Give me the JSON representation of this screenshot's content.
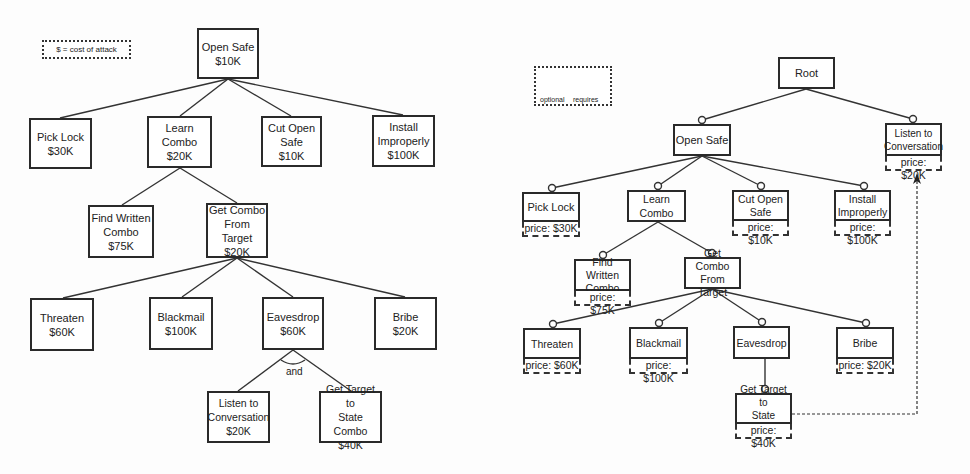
{
  "left_tree": {
    "legend": "$ = cost of attack",
    "and_label": "and",
    "nodes": {
      "open_safe": {
        "label": "Open Safe",
        "cost": "$10K"
      },
      "pick_lock": {
        "label": "Pick Lock",
        "cost": "$30K"
      },
      "learn_combo": {
        "label": "Learn Combo",
        "cost": "$20K"
      },
      "cut_open_safe": {
        "label": "Cut Open\nSafe",
        "cost": "$10K"
      },
      "install_improperly": {
        "label": "Install\nImproperly",
        "cost": "$100K"
      },
      "find_written_combo": {
        "label": "Find Written\nCombo",
        "cost": "$75K"
      },
      "get_combo_from_target": {
        "label": "Get Combo\nFrom Target",
        "cost": "$20K"
      },
      "threaten": {
        "label": "Threaten",
        "cost": "$60K"
      },
      "blackmail": {
        "label": "Blackmail",
        "cost": "$100K"
      },
      "eavesdrop": {
        "label": "Eavesdrop",
        "cost": "$60K"
      },
      "bribe": {
        "label": "Bribe",
        "cost": "$20K"
      },
      "listen_to_conversation": {
        "label": "Listen to\nConversation",
        "cost": "$20K"
      },
      "get_target_to_state_combo": {
        "label": "Get Target to\nState Combo",
        "cost": "$40K"
      }
    }
  },
  "right_tree": {
    "legend": {
      "optional": "optional",
      "requires": "requires"
    },
    "nodes": {
      "root": {
        "label": "Root"
      },
      "open_safe": {
        "label": "Open Safe"
      },
      "listen_to_conversation": {
        "label": "Listen to\nConversation",
        "price": "price: $20K"
      },
      "pick_lock": {
        "label": "Pick Lock",
        "price": "price: $30K"
      },
      "learn_combo": {
        "label": "Learn Combo"
      },
      "cut_open_safe": {
        "label": "Cut Open\nSafe",
        "price": "price: $10K"
      },
      "install_improperly": {
        "label": "Install\nImproperly",
        "price": "price: $100K"
      },
      "find_written_combo": {
        "label": "Find Written\nCombo",
        "price": "price: $75K"
      },
      "get_combo_from_target": {
        "label": "Get Combo\nFrom Target"
      },
      "threaten": {
        "label": "Threaten",
        "price": "price: $60K"
      },
      "blackmail": {
        "label": "Blackmail",
        "price": "price: $100K"
      },
      "eavesdrop": {
        "label": "Eavesdrop"
      },
      "bribe": {
        "label": "Bribe",
        "price": "price: $20K"
      },
      "get_target_to_state_combo": {
        "label": "Get Target to\nState Combo",
        "price": "price: $40K"
      }
    }
  }
}
